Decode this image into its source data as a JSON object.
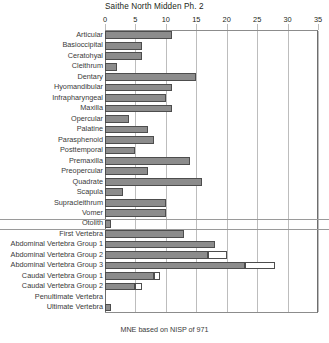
{
  "chart_data": {
    "type": "bar",
    "orientation": "horizontal",
    "title": "Saithe North Midden Ph. 2",
    "xlabel": "",
    "ylabel": "",
    "xlim": [
      0,
      35
    ],
    "xticks": [
      0,
      5,
      10,
      15,
      20,
      25,
      30,
      35
    ],
    "grid": true,
    "legend": "none",
    "footnote": "MNE based on NISP of 971",
    "categories": [
      "Articular",
      "Basioccipital",
      "Ceratohyal",
      "Cleithrum",
      "Dentary",
      "Hyomandibular",
      "Infrapharyngeal",
      "Maxilla",
      "Opercular",
      "Palatine",
      "Parasphenoid",
      "Posttemporal",
      "Premaxilla",
      "Preopercular",
      "Quadrate",
      "Scapula",
      "Supracleithrum",
      "Vomer",
      "Otolith",
      "First Vertebra",
      "Abdominal Vertebra Group 1",
      "Abdominal Vertebra Group 2",
      "Abdominal Vertebra Group 3",
      "Caudal Vertebra Group 1",
      "Caudal Vertebra Group 2",
      "Penultimate Vertebra",
      "Ultimate Vertebra"
    ],
    "series": [
      {
        "name": "MNE",
        "values": [
          11,
          6,
          6,
          2,
          15,
          11,
          10,
          11,
          4,
          7,
          8,
          5,
          14,
          7,
          16,
          3,
          10,
          10,
          1,
          13,
          18,
          17,
          23,
          8,
          5,
          0,
          1
        ]
      },
      {
        "name": "extension",
        "values": [
          0,
          0,
          0,
          0,
          0,
          0,
          0,
          0,
          0,
          0,
          0,
          0,
          0,
          0,
          0,
          0,
          0,
          0,
          0,
          0,
          0,
          3,
          5,
          1,
          1,
          0,
          0
        ]
      }
    ],
    "separators_after": [
      "Vomer",
      "Otolith"
    ]
  }
}
